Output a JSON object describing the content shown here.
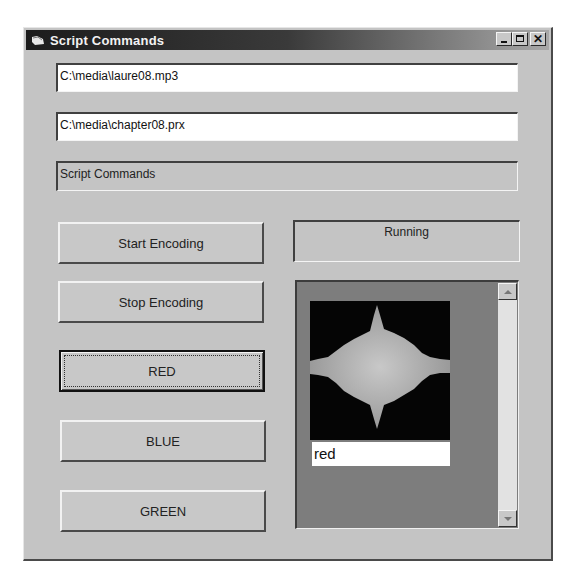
{
  "window": {
    "title": "Script Commands",
    "icon": "app-window-icon",
    "controls": {
      "minimize": "minimize-icon",
      "maximize": "maximize-icon",
      "close_glyph": "✕"
    }
  },
  "fields": {
    "input_file": "C:\\media\\laure08.mp3",
    "profile_file": "C:\\media\\chapter08.prx",
    "script_label": "Script Commands"
  },
  "buttons": {
    "start": "Start Encoding",
    "stop": "Stop Encoding",
    "red": "RED",
    "blue": "BLUE",
    "green": "GREEN"
  },
  "status": {
    "text": "Running"
  },
  "preview": {
    "image": "audio-waveform-image",
    "caption": "red"
  },
  "colors": {
    "window_bg": "#c4c4c4",
    "titlebar_start": "#1c1c1c",
    "panel_bg": "#7d7d7d",
    "image_bg": "#050505",
    "waveform": "#b0b0b0"
  }
}
